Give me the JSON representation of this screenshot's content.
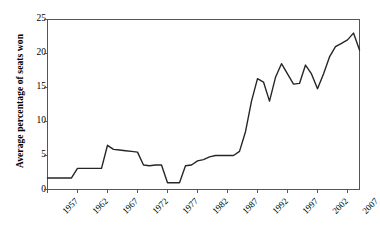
{
  "chart_data": {
    "type": "line",
    "title": "",
    "xlabel": "",
    "ylabel": "Average percentage of seats won",
    "xlim": [
      1957,
      2009
    ],
    "ylim": [
      0,
      25
    ],
    "yticks": [
      0,
      5,
      10,
      15,
      20,
      25
    ],
    "xticks": [
      1957,
      1962,
      1967,
      1972,
      1977,
      1982,
      1987,
      1992,
      1997,
      2002,
      2007
    ],
    "grid": false,
    "legend": "none",
    "line_color": "#262626",
    "x": [
      1957,
      1958,
      1959,
      1960,
      1961,
      1962,
      1963,
      1964,
      1965,
      1966,
      1967,
      1968,
      1969,
      1970,
      1971,
      1972,
      1973,
      1974,
      1975,
      1976,
      1977,
      1978,
      1979,
      1980,
      1981,
      1982,
      1983,
      1984,
      1985,
      1986,
      1987,
      1988,
      1989,
      1990,
      1991,
      1992,
      1993,
      1994,
      1995,
      1996,
      1997,
      1998,
      1999,
      2000,
      2001,
      2002,
      2003,
      2004,
      2005,
      2006,
      2007,
      2008,
      2009
    ],
    "values": [
      1.7,
      1.7,
      1.7,
      1.7,
      1.7,
      3.1,
      3.1,
      3.1,
      3.1,
      3.1,
      6.5,
      5.9,
      5.8,
      5.7,
      5.6,
      5.5,
      3.6,
      3.5,
      3.6,
      3.6,
      1.0,
      1.0,
      1.0,
      3.5,
      3.6,
      4.2,
      4.4,
      4.8,
      5.0,
      5.0,
      5.0,
      5.0,
      5.6,
      8.5,
      13.0,
      16.3,
      15.8,
      13.0,
      16.5,
      18.5,
      17.0,
      15.5,
      15.6,
      18.3,
      17.0,
      14.8,
      17.0,
      19.5,
      21.0,
      21.5,
      22.0,
      23.0,
      20.5
    ],
    "series_name": "Average percentage of seats won"
  },
  "axis": {
    "y_title": "Average percentage of seats won",
    "ytick_labels": [
      "0",
      "5",
      "10",
      "15",
      "20",
      "25"
    ],
    "xtick_labels": [
      "1957",
      "1962",
      "1967",
      "1972",
      "1977",
      "1982",
      "1987",
      "1992",
      "1997",
      "2002",
      "2007"
    ]
  }
}
